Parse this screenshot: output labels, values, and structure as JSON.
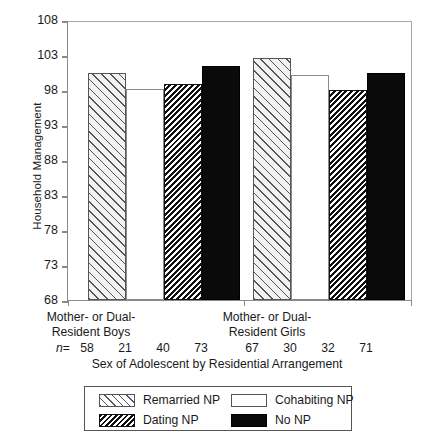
{
  "chart_data": {
    "type": "bar",
    "title": "",
    "xlabel": "Sex of Adolescent by Residential Arrangement",
    "ylabel": "Household Management",
    "ylim": [
      68,
      108
    ],
    "yticks": [
      68,
      73,
      78,
      83,
      88,
      93,
      98,
      103,
      108
    ],
    "grid": false,
    "legend_position": "below-axes",
    "categories": [
      "Mother- or Dual-Resident Boys",
      "Mother- or Dual-Resident Girls"
    ],
    "category_lines": [
      [
        "Mother- or Dual-",
        "Resident Boys"
      ],
      [
        "Mother- or Dual-",
        "Resident Girls"
      ]
    ],
    "series": [
      {
        "name": "Remarried NP",
        "key": "remarried",
        "fill": "diagonal-hatch-light",
        "values": [
          100.5,
          102.6
        ]
      },
      {
        "name": "Cohabiting NP",
        "key": "cohabiting",
        "fill": "open-white",
        "values": [
          98.2,
          100.1
        ]
      },
      {
        "name": "Dating NP",
        "key": "dating",
        "fill": "diagonal-hatch-dark",
        "values": [
          98.8,
          98.0
        ]
      },
      {
        "name": "No NP",
        "key": "nonp",
        "fill": "solid-black",
        "values": [
          101.5,
          100.4
        ]
      }
    ],
    "n_label": "n",
    "n_equals": "=",
    "n_values": [
      [
        58,
        21,
        40,
        73
      ],
      [
        67,
        30,
        32,
        71
      ]
    ],
    "colors": {
      "axis": "#8a8a8a",
      "frame": "#a8a8a8",
      "hatch": "#555555",
      "solid": "#0a0a0a",
      "text": "#1a1a1a",
      "background": "#ffffff"
    }
  }
}
